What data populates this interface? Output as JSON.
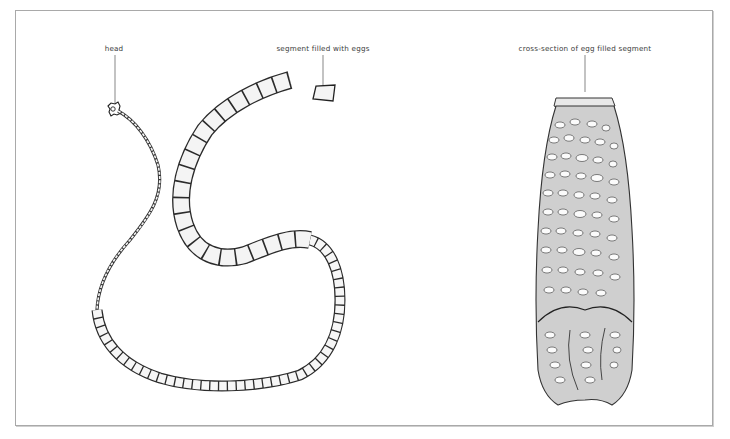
{
  "figure": {
    "labels": {
      "head": "head",
      "segment": "segment filled with eggs",
      "cross_section": "cross-section of egg filled segment"
    },
    "colors": {
      "frame": "#a9a9a9",
      "ink": "#2b2b2b",
      "label_text": "#3a3a3a",
      "segment_fill": "#f4f4f4",
      "cross_section_fill": "#cfcfcf",
      "egg_fill": "#fbfbfb"
    }
  }
}
